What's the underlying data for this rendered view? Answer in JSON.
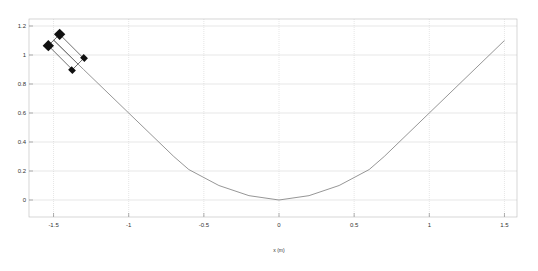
{
  "chart_data": {
    "type": "line",
    "title": "",
    "xlabel": "x (m)",
    "ylabel": "",
    "xlim": [
      -1.65,
      1.65
    ],
    "ylim": [
      -0.12,
      1.25
    ],
    "grid": true,
    "x_ticks": [
      "-1.5",
      "-1",
      "-0.5",
      "0",
      "0.5",
      "1",
      "1.5"
    ],
    "y_ticks": [
      "0",
      "0.2",
      "0.4",
      "0.6",
      "0.8",
      "1",
      "1.2"
    ],
    "series": [
      {
        "name": "path",
        "color": "#888888",
        "x": [
          -1.5,
          -1.3,
          -1.0,
          -0.7,
          -0.6,
          -0.4,
          -0.2,
          0,
          0.2,
          0.4,
          0.6,
          0.7,
          1.0,
          1.5
        ],
        "y": [
          1.1,
          0.9,
          0.6,
          0.3,
          0.21,
          0.1,
          0.03,
          0,
          0.03,
          0.1,
          0.21,
          0.3,
          0.6,
          1.1
        ]
      }
    ],
    "annotations": [
      {
        "type": "vehicle",
        "x": -1.42,
        "y": 1.0,
        "heading_deg": -45
      }
    ]
  }
}
